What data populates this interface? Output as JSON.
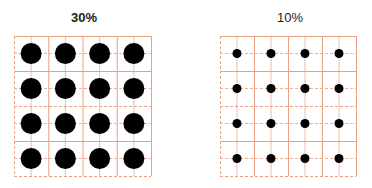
{
  "panels": [
    {
      "title": "30%",
      "title_bold": true,
      "grid": {
        "rows": 4,
        "cols": 4,
        "dot_diameter": 21,
        "dot_color": "#000000"
      }
    },
    {
      "title": "10%",
      "title_bold": false,
      "grid": {
        "rows": 4,
        "cols": 4,
        "dot_diameter": 9,
        "dot_color": "#000000"
      }
    }
  ],
  "colors": {
    "grid_line": "#e8a080",
    "background": "#ffffff"
  }
}
